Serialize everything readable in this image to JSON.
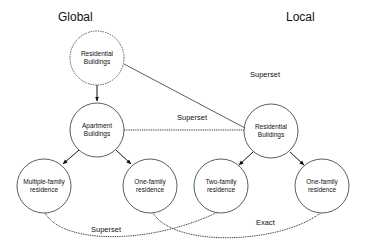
{
  "sections": {
    "global": "Global",
    "local": "Local"
  },
  "nodes": [
    {
      "id": "global-residential",
      "line1": "Residential",
      "line2": "Buildings",
      "cx": 97,
      "cy": 58,
      "style": "dashed"
    },
    {
      "id": "global-apartment",
      "line1": "Apartment",
      "line2": "Buildings",
      "cx": 97,
      "cy": 130,
      "style": "solid"
    },
    {
      "id": "global-multiple-family",
      "line1": "Multiple-family",
      "line2": "residence",
      "cx": 44,
      "cy": 192,
      "style": "solid"
    },
    {
      "id": "global-one-family",
      "line1": "One-family",
      "line2": "residence",
      "cx": 150,
      "cy": 188,
      "style": "solid"
    },
    {
      "id": "local-residential",
      "line1": "Residential",
      "line2": "Buildings",
      "cx": 271,
      "cy": 132,
      "style": "solid"
    },
    {
      "id": "local-two-family",
      "line1": "Two-family",
      "line2": "residence",
      "cx": 221,
      "cy": 188,
      "style": "solid"
    },
    {
      "id": "local-one-family",
      "line1": "One-family",
      "line2": "residence",
      "cx": 322,
      "cy": 188,
      "style": "solid"
    }
  ],
  "edges": [
    {
      "from": "global-residential",
      "to": "global-apartment",
      "type": "arrow"
    },
    {
      "from": "global-apartment",
      "to": "global-multiple-family",
      "type": "arrow"
    },
    {
      "from": "global-apartment",
      "to": "global-one-family",
      "type": "arrow"
    },
    {
      "from": "local-residential",
      "to": "local-two-family",
      "type": "arrow"
    },
    {
      "from": "local-residential",
      "to": "local-one-family",
      "type": "arrow"
    },
    {
      "from": "global-residential",
      "to": "local-residential",
      "type": "mapping",
      "label": "Superset"
    },
    {
      "from": "global-apartment",
      "to": "local-residential",
      "type": "mapping",
      "label": "Superset"
    },
    {
      "from": "global-multiple-family",
      "to": "local-two-family",
      "type": "mapping",
      "label": "Superset"
    },
    {
      "from": "global-one-family",
      "to": "local-one-family",
      "type": "mapping",
      "label": "Exact"
    }
  ],
  "labels": {
    "edge_top": "Superset",
    "edge_middle": "Superset",
    "edge_bottom_left": "Superset",
    "edge_bottom_right": "Exact"
  }
}
